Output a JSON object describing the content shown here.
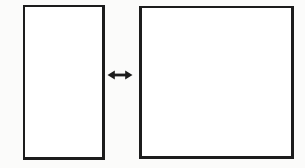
{
  "figure": {
    "type": "diagram",
    "background_color": "#fbfbfa",
    "stroke_color": "#1c1c1c",
    "fill_color": "#ffffff"
  },
  "shapes": [
    {
      "id": "rect-left",
      "name": "left-rectangle",
      "label": "",
      "x": 23,
      "y": 5,
      "width": 82,
      "height": 155,
      "fill": "#ffffff",
      "stroke": "#1c1c1c",
      "stroke_width": 2,
      "orientation": "portrait"
    },
    {
      "id": "rect-right",
      "name": "right-rectangle",
      "label": "",
      "x": 139,
      "y": 6,
      "width": 155,
      "height": 153,
      "fill": "#ffffff",
      "stroke": "#1c1c1c",
      "stroke_width": 2,
      "orientation": "square"
    }
  ],
  "connector": {
    "id": "arrow-between",
    "name": "double-headed-arrow",
    "icon": "double-arrow-horizontal-icon",
    "label": "",
    "x": 107,
    "y": 65,
    "width": 26,
    "height": 20,
    "color": "#1c1c1c",
    "heads": "both",
    "direction": "horizontal"
  },
  "annotations": {
    "caption": "",
    "left_label": "",
    "right_label": ""
  }
}
